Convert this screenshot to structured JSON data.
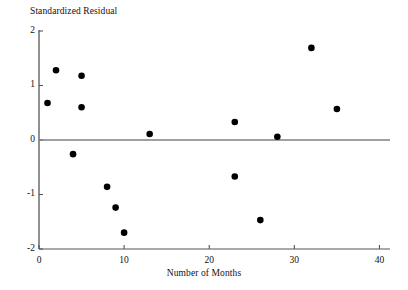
{
  "chart_data": {
    "type": "scatter",
    "title": "",
    "xlabel": "Number of Months",
    "ylabel": "Standardized Residual",
    "xlim": [
      0,
      41
    ],
    "ylim": [
      -2,
      2
    ],
    "xticks": [
      0,
      10,
      20,
      30,
      40
    ],
    "yticks": [
      2,
      1,
      0,
      -1,
      -2
    ],
    "xtick_labels": [
      "0",
      "10",
      "20",
      "30",
      "40"
    ],
    "ytick_labels": [
      "2",
      "1",
      "0",
      "-1",
      "-2"
    ],
    "grid": false,
    "legend": null,
    "reference_line": {
      "orientation": "horizontal",
      "value": 0,
      "color": "#808080"
    },
    "marker": {
      "shape": "circle",
      "color": "#000000",
      "size": 4.4
    },
    "axis_color": "#555555",
    "points": [
      {
        "x": 1,
        "y": 0.68
      },
      {
        "x": 2,
        "y": 1.28
      },
      {
        "x": 4,
        "y": -0.26
      },
      {
        "x": 5,
        "y": 1.18
      },
      {
        "x": 5,
        "y": 0.6
      },
      {
        "x": 8,
        "y": -0.86
      },
      {
        "x": 9,
        "y": -1.24
      },
      {
        "x": 10,
        "y": -1.7
      },
      {
        "x": 13,
        "y": 0.11
      },
      {
        "x": 23,
        "y": 0.33
      },
      {
        "x": 23,
        "y": -0.67
      },
      {
        "x": 26,
        "y": -1.47
      },
      {
        "x": 28,
        "y": 0.06
      },
      {
        "x": 32,
        "y": 1.69
      },
      {
        "x": 35,
        "y": 0.57
      }
    ]
  }
}
